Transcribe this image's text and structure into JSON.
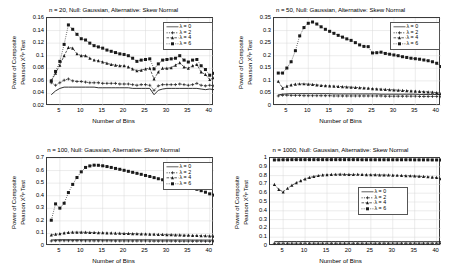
{
  "figure": {
    "xlabel": "Number of Bins",
    "ylabel_line1": "Power of Composite",
    "ylabel_line2": "Pearson X",
    "ylabel_sup": "2",
    "ylabel_sub": "P",
    "ylabel_tail": " Test",
    "legend_labels": [
      "λ = 0",
      "λ = 2",
      "λ = 4",
      "λ = 6"
    ],
    "colors": {
      "series": "#1a1a1a",
      "axis": "#3a3a3a",
      "grid": "#d8d8d8",
      "background": "#ffffff"
    }
  },
  "chart_data": [
    {
      "type": "line",
      "panel": "top-left",
      "title": "n = 20, Null: Gaussian, Alternative: Skew Normal",
      "xlabel": "Number of Bins",
      "ylabel": "Power of Composite Pearson X^2_P Test",
      "xlim": [
        2,
        41
      ],
      "ylim": [
        0.02,
        0.16
      ],
      "xticks": [
        5,
        10,
        15,
        20,
        25,
        30,
        35,
        40
      ],
      "yticks": [
        0.02,
        0.04,
        0.06,
        0.08,
        0.1,
        0.12,
        0.14,
        0.16
      ],
      "ytick_labels": [
        "0.02",
        "0.04",
        "0.06",
        "0.08",
        "0.1",
        "0.12",
        "0.14",
        "0.16"
      ],
      "grid": true,
      "legend_position": "top-right",
      "x": [
        3,
        4,
        5,
        6,
        7,
        8,
        9,
        10,
        11,
        12,
        13,
        14,
        15,
        16,
        17,
        18,
        19,
        20,
        21,
        22,
        23,
        24,
        25,
        26,
        27,
        28,
        29,
        30,
        31,
        32,
        33,
        34,
        35,
        36,
        37,
        38,
        39,
        40,
        41
      ],
      "series": [
        {
          "name": "λ = 0",
          "values": [
            0.038,
            0.044,
            0.048,
            0.05,
            0.05,
            0.05,
            0.05,
            0.05,
            0.05,
            0.05,
            0.05,
            0.049,
            0.049,
            0.049,
            0.049,
            0.049,
            0.049,
            0.049,
            0.049,
            0.048,
            0.048,
            0.048,
            0.048,
            0.048,
            0.038,
            0.045,
            0.047,
            0.048,
            0.048,
            0.048,
            0.048,
            0.048,
            0.048,
            0.048,
            0.048,
            0.047,
            0.046,
            0.047,
            0.046
          ]
        },
        {
          "name": "λ = 2",
          "values": [
            0.057,
            0.053,
            0.057,
            0.061,
            0.063,
            0.06,
            0.059,
            0.059,
            0.058,
            0.057,
            0.057,
            0.057,
            0.056,
            0.056,
            0.056,
            0.056,
            0.055,
            0.055,
            0.055,
            0.054,
            0.053,
            0.054,
            0.054,
            0.053,
            0.045,
            0.052,
            0.054,
            0.054,
            0.054,
            0.054,
            0.055,
            0.054,
            0.053,
            0.054,
            0.056,
            0.053,
            0.052,
            0.053,
            0.052
          ]
        },
        {
          "name": "λ = 4",
          "values": [
            0.06,
            0.072,
            0.085,
            0.1,
            0.113,
            0.112,
            0.103,
            0.1,
            0.1,
            0.096,
            0.093,
            0.092,
            0.09,
            0.088,
            0.086,
            0.085,
            0.084,
            0.084,
            0.082,
            0.079,
            0.076,
            0.077,
            0.079,
            0.08,
            0.063,
            0.074,
            0.08,
            0.08,
            0.081,
            0.085,
            0.089,
            0.082,
            0.08,
            0.084,
            0.086,
            0.074,
            0.07,
            0.062,
            0.065
          ]
        },
        {
          "name": "λ = 6",
          "values": [
            0.06,
            0.075,
            0.091,
            0.118,
            0.149,
            0.142,
            0.134,
            0.127,
            0.125,
            0.12,
            0.116,
            0.114,
            0.112,
            0.109,
            0.107,
            0.105,
            0.103,
            0.102,
            0.1,
            0.096,
            0.091,
            0.093,
            0.094,
            0.095,
            0.079,
            0.087,
            0.093,
            0.094,
            0.095,
            0.096,
            0.1,
            0.093,
            0.09,
            0.093,
            0.094,
            0.084,
            0.078,
            0.069,
            0.072
          ]
        }
      ]
    },
    {
      "type": "line",
      "panel": "top-right",
      "title": "n = 50, Null: Gaussian, Alternative: Skew Normal",
      "xlabel": "Number of Bins",
      "ylabel": "Power of Composite Pearson X^2_P Test",
      "xlim": [
        2,
        41
      ],
      "ylim": [
        0,
        0.35
      ],
      "xticks": [
        5,
        10,
        15,
        20,
        25,
        30,
        35,
        40
      ],
      "yticks": [
        0,
        0.05,
        0.1,
        0.15,
        0.2,
        0.25,
        0.3,
        0.35
      ],
      "ytick_labels": [
        "0",
        "0.05",
        "0.1",
        "0.15",
        "0.2",
        "0.25",
        "0.3",
        "0.35"
      ],
      "grid": true,
      "legend_position": "top-right",
      "x": [
        3,
        4,
        5,
        6,
        7,
        8,
        9,
        10,
        11,
        12,
        13,
        14,
        15,
        16,
        17,
        18,
        19,
        20,
        21,
        22,
        23,
        24,
        25,
        26,
        27,
        28,
        29,
        30,
        31,
        32,
        33,
        34,
        35,
        36,
        37,
        38,
        39,
        40,
        41
      ],
      "series": [
        {
          "name": "λ = 0",
          "values": [
            0.044,
            0.047,
            0.048,
            0.049,
            0.049,
            0.049,
            0.049,
            0.049,
            0.049,
            0.049,
            0.049,
            0.049,
            0.049,
            0.048,
            0.048,
            0.048,
            0.048,
            0.048,
            0.048,
            0.048,
            0.048,
            0.048,
            0.048,
            0.048,
            0.047,
            0.047,
            0.047,
            0.047,
            0.047,
            0.047,
            0.047,
            0.047,
            0.047,
            0.046,
            0.046,
            0.046,
            0.046,
            0.046,
            0.045
          ]
        },
        {
          "name": "λ = 2",
          "values": [
            0.04,
            0.043,
            0.043,
            0.042,
            0.042,
            0.042,
            0.041,
            0.041,
            0.041,
            0.041,
            0.041,
            0.041,
            0.041,
            0.04,
            0.04,
            0.04,
            0.04,
            0.04,
            0.04,
            0.04,
            0.04,
            0.04,
            0.04,
            0.04,
            0.04,
            0.039,
            0.039,
            0.039,
            0.039,
            0.039,
            0.039,
            0.039,
            0.039,
            0.038,
            0.038,
            0.038,
            0.038,
            0.038,
            0.037
          ]
        },
        {
          "name": "λ = 4",
          "values": [
            0.098,
            0.071,
            0.079,
            0.084,
            0.087,
            0.088,
            0.088,
            0.087,
            0.086,
            0.084,
            0.082,
            0.081,
            0.08,
            0.079,
            0.078,
            0.077,
            0.076,
            0.075,
            0.074,
            0.073,
            0.072,
            0.071,
            0.069,
            0.068,
            0.067,
            0.066,
            0.065,
            0.064,
            0.063,
            0.062,
            0.061,
            0.06,
            0.059,
            0.058,
            0.057,
            0.056,
            0.055,
            0.053,
            0.05
          ]
        },
        {
          "name": "λ = 6",
          "values": [
            0.131,
            0.131,
            0.151,
            0.176,
            0.22,
            0.279,
            0.312,
            0.329,
            0.334,
            0.326,
            0.315,
            0.305,
            0.297,
            0.289,
            0.281,
            0.274,
            0.267,
            0.261,
            0.252,
            0.243,
            0.237,
            0.236,
            0.211,
            0.212,
            0.214,
            0.209,
            0.206,
            0.203,
            0.2,
            0.196,
            0.193,
            0.19,
            0.188,
            0.186,
            0.183,
            0.18,
            0.176,
            0.17,
            0.157
          ]
        }
      ]
    },
    {
      "type": "line",
      "panel": "bottom-left",
      "title": "n = 100, Null: Gaussian, Alternative: Skew Normal",
      "xlabel": "Number of Bins",
      "ylabel": "Power of Composite Pearson X^2_P Test",
      "xlim": [
        2,
        41
      ],
      "ylim": [
        0,
        0.7
      ],
      "xticks": [
        5,
        10,
        15,
        20,
        25,
        30,
        35,
        40
      ],
      "yticks": [
        0,
        0.1,
        0.2,
        0.3,
        0.4,
        0.5,
        0.6,
        0.7
      ],
      "ytick_labels": [
        "0",
        "0.1",
        "0.2",
        "0.3",
        "0.4",
        "0.5",
        "0.6",
        "0.7"
      ],
      "grid": true,
      "legend_position": "top-right",
      "x": [
        3,
        4,
        5,
        6,
        7,
        8,
        9,
        10,
        11,
        12,
        13,
        14,
        15,
        16,
        17,
        18,
        19,
        20,
        21,
        22,
        23,
        24,
        25,
        26,
        27,
        28,
        29,
        30,
        31,
        32,
        33,
        34,
        35,
        36,
        37,
        38,
        39,
        40,
        41
      ],
      "series": [
        {
          "name": "λ = 0",
          "values": [
            0.048,
            0.049,
            0.05,
            0.05,
            0.05,
            0.05,
            0.05,
            0.05,
            0.05,
            0.05,
            0.05,
            0.05,
            0.049,
            0.049,
            0.049,
            0.049,
            0.049,
            0.049,
            0.049,
            0.049,
            0.049,
            0.049,
            0.049,
            0.049,
            0.048,
            0.048,
            0.048,
            0.048,
            0.048,
            0.048,
            0.048,
            0.048,
            0.048,
            0.047,
            0.047,
            0.047,
            0.047,
            0.047,
            0.046
          ]
        },
        {
          "name": "λ = 2",
          "values": [
            0.04,
            0.042,
            0.042,
            0.042,
            0.042,
            0.042,
            0.042,
            0.042,
            0.041,
            0.041,
            0.041,
            0.041,
            0.041,
            0.041,
            0.041,
            0.04,
            0.04,
            0.04,
            0.04,
            0.04,
            0.04,
            0.04,
            0.04,
            0.039,
            0.039,
            0.039,
            0.039,
            0.039,
            0.039,
            0.039,
            0.038,
            0.038,
            0.038,
            0.038,
            0.038,
            0.038,
            0.037,
            0.037,
            0.036
          ]
        },
        {
          "name": "λ = 4",
          "values": [
            0.088,
            0.093,
            0.098,
            0.104,
            0.108,
            0.11,
            0.11,
            0.11,
            0.109,
            0.108,
            0.107,
            0.106,
            0.105,
            0.104,
            0.103,
            0.102,
            0.101,
            0.1,
            0.099,
            0.098,
            0.097,
            0.096,
            0.095,
            0.094,
            0.093,
            0.092,
            0.091,
            0.09,
            0.089,
            0.088,
            0.087,
            0.086,
            0.085,
            0.084,
            0.083,
            0.082,
            0.081,
            0.079,
            0.077
          ]
        },
        {
          "name": "λ = 6",
          "values": [
            0.205,
            0.335,
            0.301,
            0.34,
            0.425,
            0.49,
            0.545,
            0.59,
            0.625,
            0.637,
            0.643,
            0.642,
            0.638,
            0.632,
            0.625,
            0.617,
            0.61,
            0.602,
            0.594,
            0.586,
            0.578,
            0.57,
            0.561,
            0.553,
            0.544,
            0.535,
            0.527,
            0.518,
            0.509,
            0.5,
            0.491,
            0.482,
            0.472,
            0.462,
            0.451,
            0.44,
            0.428,
            0.415,
            0.405
          ]
        }
      ]
    },
    {
      "type": "line",
      "panel": "bottom-right",
      "title": "n = 1000, Null: Gaussian, Alternative: Skew Normal",
      "xlabel": "Number of Bins",
      "ylabel": "Power of Composite Pearson X^2_P Test",
      "xlim": [
        2,
        41
      ],
      "ylim": [
        0,
        1
      ],
      "xticks": [
        5,
        10,
        15,
        20,
        25,
        30,
        35,
        40
      ],
      "yticks": [
        0,
        0.1,
        0.2,
        0.3,
        0.4,
        0.5,
        0.6,
        0.7,
        0.8,
        0.9,
        1
      ],
      "ytick_labels": [
        "0",
        "0.1",
        "0.2",
        "0.3",
        "0.4",
        "0.5",
        "0.6",
        "0.7",
        "0.8",
        "0.9",
        "1"
      ],
      "grid": true,
      "legend_position": "middle-right",
      "x": [
        3,
        4,
        5,
        6,
        7,
        8,
        9,
        10,
        11,
        12,
        13,
        14,
        15,
        16,
        17,
        18,
        19,
        20,
        21,
        22,
        23,
        24,
        25,
        26,
        27,
        28,
        29,
        30,
        31,
        32,
        33,
        34,
        35,
        36,
        37,
        38,
        39,
        40,
        41
      ],
      "series": [
        {
          "name": "λ = 0",
          "values": [
            0.049,
            0.05,
            0.05,
            0.05,
            0.05,
            0.05,
            0.05,
            0.05,
            0.05,
            0.05,
            0.05,
            0.05,
            0.05,
            0.05,
            0.05,
            0.05,
            0.05,
            0.05,
            0.05,
            0.05,
            0.05,
            0.05,
            0.05,
            0.05,
            0.049,
            0.049,
            0.049,
            0.049,
            0.049,
            0.049,
            0.049,
            0.049,
            0.049,
            0.049,
            0.049,
            0.049,
            0.049,
            0.049,
            0.048
          ]
        },
        {
          "name": "λ = 2",
          "values": [
            0.03,
            0.031,
            0.031,
            0.031,
            0.031,
            0.031,
            0.031,
            0.031,
            0.031,
            0.031,
            0.031,
            0.031,
            0.031,
            0.031,
            0.031,
            0.031,
            0.031,
            0.031,
            0.031,
            0.031,
            0.031,
            0.031,
            0.031,
            0.031,
            0.031,
            0.031,
            0.031,
            0.031,
            0.031,
            0.031,
            0.031,
            0.031,
            0.031,
            0.031,
            0.031,
            0.031,
            0.031,
            0.031,
            0.03
          ]
        },
        {
          "name": "λ = 4",
          "values": [
            0.7,
            0.643,
            0.615,
            0.655,
            0.69,
            0.718,
            0.742,
            0.762,
            0.778,
            0.79,
            0.8,
            0.807,
            0.811,
            0.813,
            0.814,
            0.816,
            0.814,
            0.812,
            0.813,
            0.814,
            0.812,
            0.81,
            0.81,
            0.809,
            0.808,
            0.807,
            0.806,
            0.805,
            0.803,
            0.801,
            0.799,
            0.797,
            0.795,
            0.792,
            0.789,
            0.786,
            0.782,
            0.778,
            0.763
          ]
        },
        {
          "name": "λ = 6",
          "values": [
            0.978,
            0.979,
            0.98,
            0.98,
            0.981,
            0.981,
            0.981,
            0.981,
            0.981,
            0.981,
            0.981,
            0.981,
            0.981,
            0.981,
            0.981,
            0.981,
            0.981,
            0.981,
            0.981,
            0.981,
            0.98,
            0.98,
            0.98,
            0.98,
            0.98,
            0.98,
            0.98,
            0.98,
            0.98,
            0.98,
            0.98,
            0.98,
            0.979,
            0.979,
            0.979,
            0.979,
            0.978,
            0.978,
            0.977
          ]
        }
      ]
    }
  ]
}
